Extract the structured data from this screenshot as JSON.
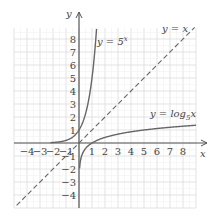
{
  "chart_data": {
    "type": "line",
    "title": "",
    "xlabel": "x",
    "ylabel": "y",
    "xlim": [
      -5,
      9
    ],
    "ylim": [
      -5,
      9
    ],
    "grid": true,
    "x_ticks": [
      -4,
      -3,
      -2,
      -1,
      1,
      2,
      3,
      4,
      5,
      6,
      7,
      8
    ],
    "y_ticks": [
      -4,
      -3,
      -2,
      -1,
      1,
      2,
      3,
      4,
      5,
      6,
      7,
      8
    ],
    "x_tick_labels": [
      "−4",
      "−3",
      "−2",
      "−1",
      "1",
      "2",
      "3",
      "4",
      "5",
      "6",
      "7",
      "8"
    ],
    "y_tick_labels": [
      "−4",
      "−3",
      "−2",
      "−1",
      "1",
      "2",
      "3",
      "4",
      "5",
      "6",
      "7",
      "8"
    ],
    "series": [
      {
        "name": "y = 5^x",
        "style": "solid",
        "x": [
          -2,
          -1.5,
          -1,
          -0.5,
          0,
          0.5,
          1,
          1.2,
          1.29,
          1.35
        ],
        "y": [
          0.04,
          0.09,
          0.2,
          0.45,
          1,
          2.24,
          5,
          6.9,
          8,
          8.8
        ]
      },
      {
        "name": "y = x",
        "style": "dashed",
        "x": [
          -5,
          9
        ],
        "y": [
          -5,
          9
        ]
      },
      {
        "name": "y = log_5 x",
        "style": "solid",
        "x": [
          0.04,
          0.09,
          0.2,
          0.45,
          1,
          2.24,
          5,
          9
        ],
        "y": [
          -2,
          -1.5,
          -1,
          -0.5,
          0,
          0.5,
          1,
          1.37
        ]
      }
    ],
    "annotations": [
      {
        "text": "y = 5^x",
        "x": 1.5,
        "y": 7.7
      },
      {
        "text": "y = x",
        "x": 6.5,
        "y": 8.3
      },
      {
        "text": "y = log_5 x",
        "x": 4.3,
        "y": 2
      }
    ]
  },
  "labels": {
    "x_axis": "x",
    "y_axis": "y",
    "exp_curve": {
      "pre": "y = 5",
      "sup": "x"
    },
    "identity_line": "y = x",
    "log_curve": {
      "pre": "y = log",
      "sub": "5",
      "post": "x"
    }
  }
}
